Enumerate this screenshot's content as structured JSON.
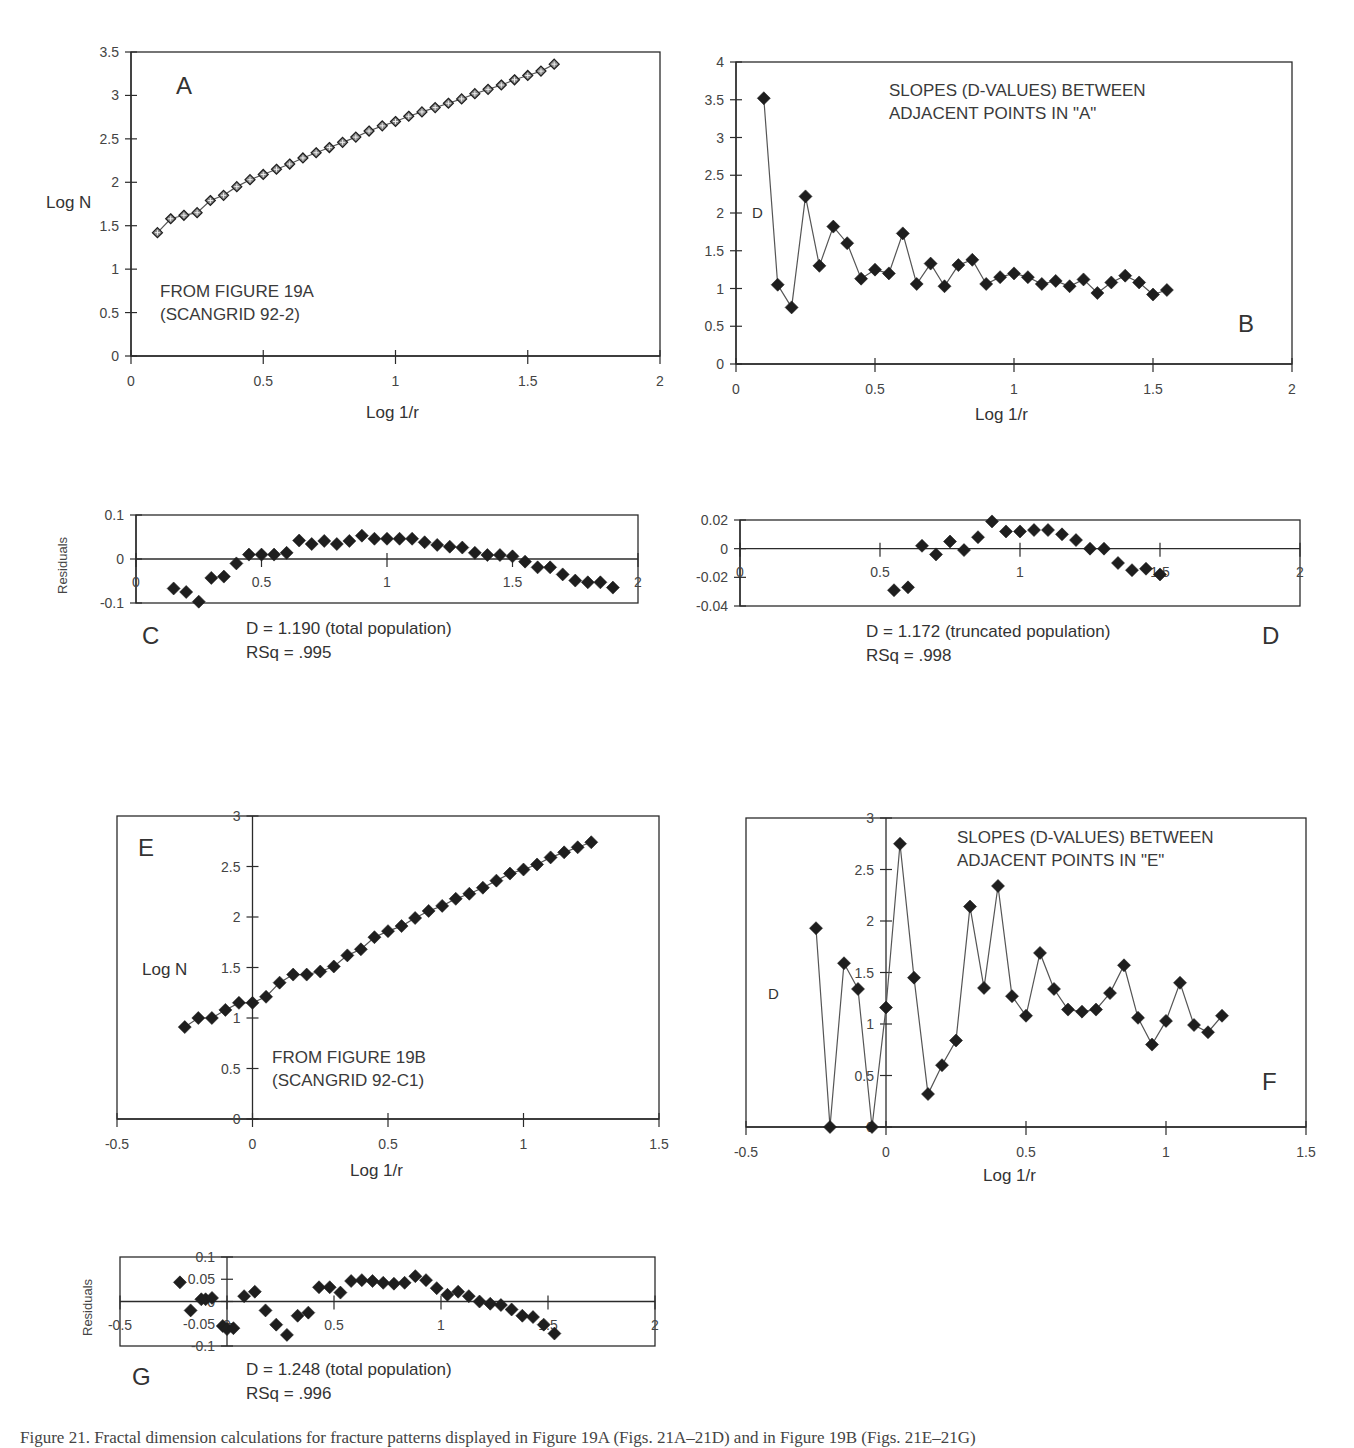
{
  "figure": {
    "caption": "Figure 21. Fractal dimension calculations for fracture patterns displayed in Figure 19A (Figs. 21A–21D) and in Figure 19B (Figs. 21E–21G)"
  },
  "panels": {
    "A": {
      "letter": "A",
      "ylabel": "Log  N",
      "xlabel": "Log 1/r",
      "note1": "FROM FIGURE 19A",
      "note2": "(SCANGRID 92-2)"
    },
    "B": {
      "letter": "B",
      "ylabel": "D",
      "xlabel": "Log 1/r",
      "note1": "SLOPES (D-VALUES) BETWEEN",
      "note2": "ADJACENT POINTS IN \"A\""
    },
    "C": {
      "letter": "C",
      "ylabel": "Residuals",
      "stat1": "D = 1.190 (total population)",
      "stat2": "RSq = .995"
    },
    "D": {
      "letter": "D",
      "stat1": "D = 1.172 (truncated population)",
      "stat2": "RSq = .998"
    },
    "E": {
      "letter": "E",
      "ylabel": "Log  N",
      "xlabel": "Log 1/r",
      "note1": "FROM FIGURE 19B",
      "note2": "(SCANGRID 92-C1)"
    },
    "F": {
      "letter": "F",
      "ylabel": "D",
      "xlabel": "Log 1/r",
      "note1": "SLOPES (D-VALUES) BETWEEN",
      "note2": "ADJACENT POINTS IN \"E\""
    },
    "G": {
      "letter": "G",
      "ylabel": "Residuals",
      "stat1": "D = 1.248 (total population)",
      "stat2": "RSq = .996"
    }
  },
  "colors": {
    "axis": "#2b2b2b",
    "marker": "#1e1e1e",
    "line": "#555555",
    "text": "#333333"
  },
  "chart_data": [
    {
      "id": "A",
      "type": "line",
      "title": "A",
      "xlabel": "Log 1/r",
      "ylabel": "Log N",
      "xlim": [
        0,
        2
      ],
      "ylim": [
        0,
        3.5
      ],
      "xticks": [
        0,
        0.5,
        1,
        1.5,
        2
      ],
      "yticks": [
        0,
        0.5,
        1,
        1.5,
        2,
        2.5,
        3,
        3.5
      ],
      "annotations": [
        "FROM FIGURE 19A",
        "(SCANGRID 92-2)"
      ],
      "marker": "open-diamond",
      "x": [
        0.1,
        0.15,
        0.2,
        0.25,
        0.3,
        0.35,
        0.4,
        0.45,
        0.5,
        0.55,
        0.6,
        0.65,
        0.7,
        0.75,
        0.8,
        0.85,
        0.9,
        0.95,
        1.0,
        1.05,
        1.1,
        1.15,
        1.2,
        1.25,
        1.3,
        1.35,
        1.4,
        1.45,
        1.5,
        1.55,
        1.6
      ],
      "y": [
        1.42,
        1.58,
        1.62,
        1.65,
        1.79,
        1.85,
        1.95,
        2.03,
        2.09,
        2.15,
        2.21,
        2.28,
        2.34,
        2.4,
        2.46,
        2.52,
        2.59,
        2.65,
        2.7,
        2.76,
        2.81,
        2.86,
        2.91,
        2.96,
        3.02,
        3.07,
        3.12,
        3.18,
        3.23,
        3.28,
        3.36
      ]
    },
    {
      "id": "B",
      "type": "line",
      "title": "SLOPES (D-VALUES) BETWEEN ADJACENT POINTS IN \"A\"",
      "xlabel": "Log 1/r",
      "ylabel": "D",
      "xlim": [
        0,
        2
      ],
      "ylim": [
        0,
        4
      ],
      "xticks": [
        0,
        0.5,
        1,
        1.5,
        2
      ],
      "yticks": [
        0,
        0.5,
        1,
        1.5,
        2,
        2.5,
        3,
        3.5,
        4
      ],
      "marker": "filled-diamond",
      "x": [
        0.1,
        0.15,
        0.2,
        0.25,
        0.3,
        0.35,
        0.4,
        0.45,
        0.5,
        0.55,
        0.6,
        0.65,
        0.7,
        0.75,
        0.8,
        0.85,
        0.9,
        0.95,
        1.0,
        1.05,
        1.1,
        1.15,
        1.2,
        1.25,
        1.3,
        1.35,
        1.4,
        1.45,
        1.5,
        1.55
      ],
      "y": [
        3.52,
        1.05,
        0.75,
        2.22,
        1.3,
        1.82,
        1.6,
        1.13,
        1.25,
        1.2,
        1.73,
        1.06,
        1.33,
        1.03,
        1.31,
        1.38,
        1.06,
        1.15,
        1.2,
        1.15,
        1.06,
        1.1,
        1.03,
        1.12,
        0.94,
        1.08,
        1.17,
        1.08,
        0.92,
        0.98
      ]
    },
    {
      "id": "C",
      "type": "scatter",
      "title": "Residuals (total population)",
      "xlabel": "",
      "ylabel": "Residuals",
      "xlim": [
        0,
        2
      ],
      "ylim": [
        -0.1,
        0.1
      ],
      "xticks": [
        0,
        0.5,
        1,
        1.5,
        2
      ],
      "yticks": [
        -0.1,
        0,
        0.1
      ],
      "annotations": [
        "D = 1.190 (total population)",
        "RSq = .995"
      ],
      "x": [
        0.15,
        0.2,
        0.25,
        0.3,
        0.35,
        0.4,
        0.45,
        0.5,
        0.55,
        0.6,
        0.65,
        0.7,
        0.75,
        0.8,
        0.85,
        0.9,
        0.95,
        1.0,
        1.05,
        1.1,
        1.15,
        1.2,
        1.25,
        1.3,
        1.35,
        1.4,
        1.45,
        1.5,
        1.55,
        1.6,
        1.65,
        1.7,
        1.75,
        1.8,
        1.85,
        1.9
      ],
      "y": [
        -0.067,
        -0.075,
        -0.097,
        -0.043,
        -0.04,
        -0.01,
        0.01,
        0.01,
        0.01,
        0.014,
        0.042,
        0.034,
        0.041,
        0.034,
        0.041,
        0.053,
        0.046,
        0.046,
        0.046,
        0.046,
        0.038,
        0.032,
        0.028,
        0.026,
        0.014,
        0.009,
        0.009,
        0.006,
        -0.006,
        -0.019,
        -0.019,
        -0.035,
        -0.049,
        -0.053,
        -0.053,
        -0.065
      ]
    },
    {
      "id": "D",
      "type": "scatter",
      "title": "Residuals (truncated population)",
      "xlabel": "",
      "ylabel": "",
      "xlim": [
        0,
        2
      ],
      "ylim": [
        -0.04,
        0.02
      ],
      "xticks": [
        0,
        0.5,
        1,
        1.5,
        2
      ],
      "yticks": [
        -0.04,
        -0.02,
        0,
        0.02
      ],
      "annotations": [
        "D = 1.172 (truncated population)",
        "RSq = .998"
      ],
      "x": [
        0.55,
        0.6,
        0.65,
        0.7,
        0.75,
        0.8,
        0.85,
        0.9,
        0.95,
        1.0,
        1.05,
        1.1,
        1.15,
        1.2,
        1.25,
        1.3,
        1.35,
        1.4,
        1.45,
        1.5
      ],
      "y": [
        -0.029,
        -0.027,
        0.002,
        -0.004,
        0.005,
        -0.001,
        0.008,
        0.019,
        0.012,
        0.012,
        0.013,
        0.013,
        0.01,
        0.006,
        0.0,
        0.0,
        -0.01,
        -0.015,
        -0.014,
        -0.018
      ]
    },
    {
      "id": "E",
      "type": "line",
      "title": "E",
      "xlabel": "Log 1/r",
      "ylabel": "Log N",
      "xlim": [
        -0.5,
        1.5
      ],
      "ylim": [
        0,
        3
      ],
      "xticks": [
        -0.5,
        0,
        0.5,
        1,
        1.5
      ],
      "yticks": [
        0,
        0.5,
        1,
        1.5,
        2,
        2.5,
        3
      ],
      "annotations": [
        "FROM FIGURE 19B",
        "(SCANGRID 92-C1)"
      ],
      "marker": "filled-diamond",
      "x": [
        -0.25,
        -0.2,
        -0.15,
        -0.1,
        -0.05,
        0.0,
        0.05,
        0.1,
        0.15,
        0.2,
        0.25,
        0.3,
        0.35,
        0.4,
        0.45,
        0.5,
        0.55,
        0.6,
        0.65,
        0.7,
        0.75,
        0.8,
        0.85,
        0.9,
        0.95,
        1.0,
        1.05,
        1.1,
        1.15,
        1.2,
        1.25
      ],
      "y": [
        0.91,
        1.0,
        1.0,
        1.08,
        1.15,
        1.15,
        1.21,
        1.35,
        1.43,
        1.43,
        1.46,
        1.51,
        1.62,
        1.68,
        1.8,
        1.86,
        1.91,
        1.99,
        2.06,
        2.11,
        2.18,
        2.23,
        2.29,
        2.36,
        2.43,
        2.47,
        2.52,
        2.59,
        2.64,
        2.69,
        2.74
      ]
    },
    {
      "id": "F",
      "type": "line",
      "title": "SLOPES (D-VALUES) BETWEEN ADJACENT POINTS IN \"E\"",
      "xlabel": "Log 1/r",
      "ylabel": "D",
      "xlim": [
        -0.5,
        1.5
      ],
      "ylim": [
        0,
        3
      ],
      "xticks": [
        -0.5,
        0,
        0.5,
        1,
        1.5
      ],
      "yticks": [
        0,
        0.5,
        1,
        1.5,
        2,
        2.5,
        3
      ],
      "marker": "filled-diamond",
      "x": [
        -0.25,
        -0.2,
        -0.15,
        -0.1,
        -0.05,
        0.0,
        0.05,
        0.1,
        0.15,
        0.2,
        0.25,
        0.3,
        0.35,
        0.4,
        0.45,
        0.5,
        0.55,
        0.6,
        0.65,
        0.7,
        0.75,
        0.8,
        0.85,
        0.9,
        0.95,
        1.0,
        1.05,
        1.1,
        1.15,
        1.2
      ],
      "y": [
        1.93,
        0.0,
        1.59,
        1.34,
        0.0,
        1.16,
        2.75,
        1.45,
        0.32,
        0.6,
        0.84,
        2.14,
        1.35,
        2.34,
        1.27,
        1.08,
        1.69,
        1.34,
        1.14,
        1.12,
        1.14,
        1.3,
        1.57,
        1.06,
        0.8,
        1.03,
        1.4,
        0.99,
        0.92,
        1.08
      ]
    },
    {
      "id": "G",
      "type": "scatter",
      "title": "Residuals (total population)",
      "xlabel": "",
      "ylabel": "Residuals",
      "xlim": [
        -0.5,
        2
      ],
      "ylim": [
        -0.1,
        0.1
      ],
      "xticks": [
        -0.5,
        0,
        0.5,
        1,
        1.5,
        2
      ],
      "yticks": [
        -0.1,
        -0.05,
        0,
        0.05,
        0.1
      ],
      "annotations": [
        "D = 1.248 (total population)",
        "RSq = .996"
      ],
      "x": [
        -0.22,
        -0.17,
        -0.12,
        -0.1,
        -0.07,
        -0.02,
        0.0,
        0.03,
        0.08,
        0.13,
        0.18,
        0.23,
        0.28,
        0.33,
        0.38,
        0.43,
        0.48,
        0.53,
        0.58,
        0.63,
        0.68,
        0.73,
        0.78,
        0.83,
        0.88,
        0.93,
        0.98,
        1.03,
        1.08,
        1.13,
        1.18,
        1.23,
        1.28,
        1.33,
        1.38,
        1.43,
        1.48,
        1.53
      ],
      "y": [
        0.043,
        -0.02,
        0.005,
        0.005,
        0.008,
        -0.055,
        -0.062,
        -0.06,
        0.012,
        0.022,
        -0.02,
        -0.052,
        -0.075,
        -0.032,
        -0.025,
        0.032,
        0.032,
        0.02,
        0.046,
        0.048,
        0.046,
        0.042,
        0.04,
        0.042,
        0.057,
        0.048,
        0.03,
        0.015,
        0.022,
        0.012,
        0.0,
        -0.005,
        -0.008,
        -0.018,
        -0.032,
        -0.035,
        -0.052,
        -0.072
      ]
    }
  ]
}
